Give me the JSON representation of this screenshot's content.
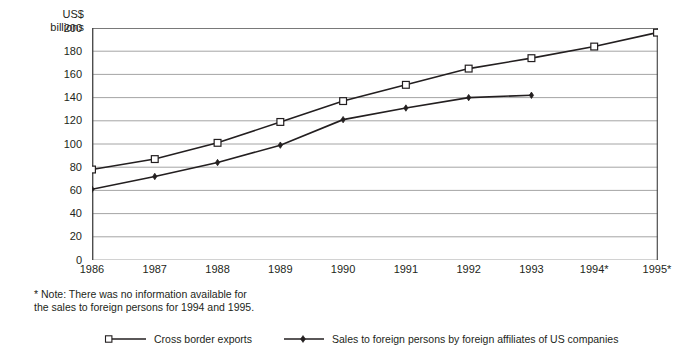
{
  "chart_data": {
    "type": "line",
    "title": "",
    "xlabel": "",
    "ylabel": "US$\nbillions",
    "ylim": [
      0,
      200
    ],
    "ytick_values": [
      200,
      180,
      160,
      140,
      120,
      100,
      80,
      60,
      40,
      20,
      0
    ],
    "grid": true,
    "legend_position": "bottom",
    "categories": [
      "1986",
      "1987",
      "1988",
      "1989",
      "1990",
      "1991",
      "1992",
      "1993",
      "1994*",
      "1995*"
    ],
    "series": [
      {
        "name": "Cross border exports",
        "marker": "open-square",
        "color": "#231f20",
        "values": [
          78,
          87,
          101,
          119,
          137,
          151,
          165,
          174,
          184,
          196
        ]
      },
      {
        "name": "Sales to foreign persons by foreign affiliates of US companies",
        "marker": "small-diamond",
        "color": "#231f20",
        "values": [
          61,
          72,
          84,
          99,
          121,
          131,
          140,
          142,
          null,
          null
        ]
      }
    ],
    "annotations": [
      "* Note: There was no information available for\nthe sales to foreign persons for 1994 and 1995."
    ]
  },
  "axis": {
    "unit_label": "US$\nbillions"
  },
  "note": {
    "text": "* Note: There was no information available for\nthe sales to foreign persons for 1994 and 1995."
  },
  "legend": {
    "items": [
      {
        "label": "Cross border exports"
      },
      {
        "label": "Sales to foreign persons by foreign affiliates of US companies"
      }
    ]
  },
  "colors": {
    "ink": "#231f20",
    "grid": "#9a9a9a",
    "axis": "#4d4d4d",
    "background": "#ffffff"
  }
}
